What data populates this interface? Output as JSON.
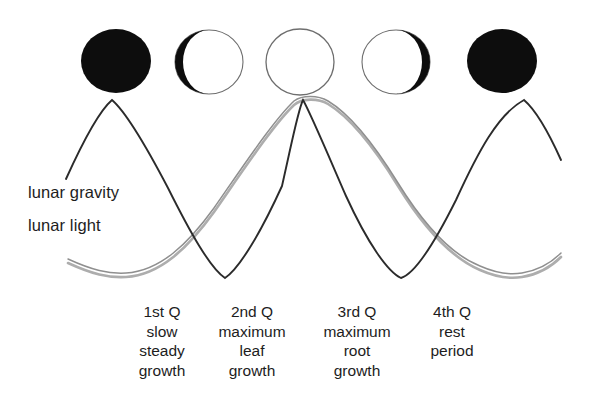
{
  "diagram": {
    "background_color": "#ffffff",
    "gravity_curve_color": "#2b2b2b",
    "light_curve_color": "#9a9a9a",
    "moon_dark_color": "#0d0d0d",
    "moon_outline_color": "#6e6e6e"
  },
  "curve_labels": {
    "gravity": "lunar gravity",
    "light": "lunar light"
  },
  "moons": [
    {
      "name": "new-moon-left",
      "phase": "full-dark",
      "cx": 116,
      "cy": 61,
      "rx": 35,
      "ry": 32,
      "illuminated_side": "none"
    },
    {
      "name": "waning-crescent",
      "phase": "dark-left-crescent",
      "cx": 209,
      "cy": 62,
      "rx": 34,
      "ry": 32,
      "illuminated_side": "right"
    },
    {
      "name": "full-moon-center",
      "phase": "empty-circle",
      "cx": 300,
      "cy": 62,
      "rx": 34,
      "ry": 33,
      "illuminated_side": "all"
    },
    {
      "name": "waxing-crescent",
      "phase": "white-left-crescent",
      "cx": 396,
      "cy": 62,
      "rx": 34,
      "ry": 32,
      "illuminated_side": "left"
    },
    {
      "name": "new-moon-right",
      "phase": "full-dark",
      "cx": 502,
      "cy": 61,
      "rx": 35,
      "ry": 32,
      "illuminated_side": "none"
    }
  ],
  "quarters": [
    {
      "name": "1st-quarter",
      "center_x": 162,
      "lines": [
        "1st Q",
        "slow",
        "steady",
        "growth"
      ]
    },
    {
      "name": "2nd-quarter",
      "center_x": 252,
      "lines": [
        "2nd Q",
        "maximum",
        "leaf",
        "growth"
      ]
    },
    {
      "name": "3rd-quarter",
      "center_x": 357,
      "lines": [
        "3rd Q",
        "maximum",
        "root",
        "growth"
      ]
    },
    {
      "name": "4th-quarter",
      "center_x": 452,
      "lines": [
        "4th Q",
        "rest",
        "period"
      ]
    }
  ],
  "chart_data": {
    "type": "line",
    "xlabel": "",
    "ylabel": "",
    "grid": false,
    "legend_position": "inline-left",
    "x_tick_labels": [
      "1st Q",
      "2nd Q",
      "3rd Q",
      "4th Q"
    ],
    "series": [
      {
        "name": "lunar gravity",
        "style": "solid-dark",
        "color": "#2b2b2b",
        "description": "Peaks at the new-moon positions (left and right), troughs between quarters, and peaks again at the full-moon center.",
        "path_points": [
          [
            66,
            178
          ],
          [
            90,
            128
          ],
          [
            112,
            100
          ],
          [
            140,
            120
          ],
          [
            176,
            182
          ],
          [
            212,
            250
          ],
          [
            225,
            278
          ],
          [
            240,
            258
          ],
          [
            268,
            190
          ],
          [
            295,
            112
          ],
          [
            302,
            100
          ],
          [
            315,
            128
          ],
          [
            344,
            200
          ],
          [
            380,
            258
          ],
          [
            400,
            277
          ],
          [
            415,
            278
          ],
          [
            436,
            240
          ],
          [
            470,
            166
          ],
          [
            500,
            115
          ],
          [
            525,
            100
          ],
          [
            545,
            130
          ],
          [
            560,
            160
          ]
        ]
      },
      {
        "name": "lunar light",
        "style": "double-line-light",
        "color": "#9a9a9a",
        "description": "Mirror of the gravity curve: troughs at the new-moon positions and a broad flat peak at the full-moon center.",
        "path_points": [
          [
            68,
            262
          ],
          [
            95,
            272
          ],
          [
            125,
            277
          ],
          [
            160,
            266
          ],
          [
            200,
            230
          ],
          [
            240,
            176
          ],
          [
            280,
            120
          ],
          [
            302,
            101
          ],
          [
            325,
            99
          ],
          [
            350,
            110
          ],
          [
            388,
            152
          ],
          [
            428,
            208
          ],
          [
            466,
            250
          ],
          [
            500,
            272
          ],
          [
            520,
            277
          ],
          [
            545,
            270
          ],
          [
            560,
            258
          ]
        ]
      }
    ]
  }
}
